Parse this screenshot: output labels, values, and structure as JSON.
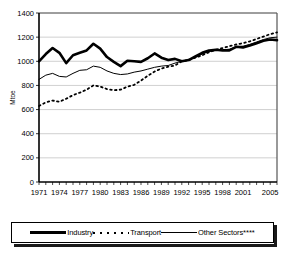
{
  "chart_data": {
    "type": "line",
    "title": "",
    "xlabel": "",
    "ylabel": "Mtoe",
    "ylim": [
      0,
      1400
    ],
    "ytick_values": [
      0,
      200,
      400,
      600,
      800,
      1000,
      1200,
      1400
    ],
    "xlim": [
      1971,
      2006
    ],
    "xtick_labels": [
      "1971",
      "1974",
      "1977",
      "1980",
      "1983",
      "1986",
      "1989",
      "1992",
      "1995",
      "1998",
      "2001",
      "2005"
    ],
    "xtick_values": [
      1971,
      1974,
      1977,
      1980,
      1983,
      1986,
      1989,
      1992,
      1995,
      1998,
      2001,
      2005
    ],
    "grid": true,
    "legend_position": "bottom",
    "x": [
      1971,
      1972,
      1973,
      1974,
      1975,
      1976,
      1977,
      1978,
      1979,
      1980,
      1981,
      1982,
      1983,
      1984,
      1985,
      1986,
      1987,
      1988,
      1989,
      1990,
      1991,
      1992,
      1993,
      1994,
      1995,
      1996,
      1997,
      1998,
      1999,
      2000,
      2001,
      2002,
      2003,
      2004,
      2005,
      2006
    ],
    "series": [
      {
        "name": "Industry",
        "style": "solid-thick",
        "color": "#000000",
        "values": [
          1000,
          1060,
          1110,
          1070,
          985,
          1050,
          1070,
          1090,
          1145,
          1105,
          1035,
          995,
          960,
          1005,
          1000,
          995,
          1025,
          1065,
          1030,
          1010,
          1020,
          1000,
          1010,
          1040,
          1070,
          1090,
          1095,
          1090,
          1090,
          1120,
          1115,
          1130,
          1150,
          1170,
          1180,
          1175
        ]
      },
      {
        "name": "Transport",
        "style": "dotted",
        "color": "#000000",
        "values": [
          630,
          660,
          675,
          665,
          690,
          720,
          740,
          765,
          800,
          790,
          770,
          760,
          765,
          790,
          805,
          840,
          880,
          915,
          940,
          955,
          965,
          1000,
          1010,
          1030,
          1050,
          1075,
          1095,
          1110,
          1125,
          1140,
          1150,
          1165,
          1185,
          1205,
          1225,
          1240
        ]
      },
      {
        "name": "Other Sectors****",
        "style": "solid-thin",
        "color": "#000000",
        "values": [
          850,
          885,
          900,
          875,
          870,
          900,
          925,
          930,
          960,
          950,
          920,
          900,
          890,
          895,
          910,
          920,
          935,
          950,
          960,
          965,
          985,
          1000,
          1010,
          1030,
          1060,
          1080,
          1090,
          1095,
          1100,
          1120,
          1125,
          1140,
          1160,
          1180,
          1195,
          1200
        ]
      }
    ]
  },
  "legend": {
    "items": [
      {
        "label": "Industry",
        "style": "solid-thick"
      },
      {
        "label": "Transport",
        "style": "dotted"
      },
      {
        "label": "Other Sectors",
        "suffix": "****",
        "style": "solid-thin"
      }
    ]
  }
}
